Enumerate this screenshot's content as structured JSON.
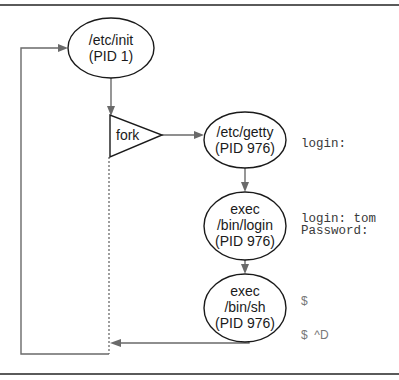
{
  "diagram": {
    "nodes": {
      "init": {
        "line1": "/etc/init",
        "line2": "(PID 1)"
      },
      "fork": {
        "label": "fork"
      },
      "getty": {
        "line1": "/etc/getty",
        "line2": "(PID 976)"
      },
      "login": {
        "line1": "exec",
        "line2": "/bin/login",
        "line3": "(PID 976)"
      },
      "shell": {
        "line1": "exec",
        "line2": "/bin/sh",
        "line3": "(PID 976)"
      }
    },
    "terminal_output": {
      "getty_prompt": "login:",
      "login_line1": "login: tom",
      "login_line2": "Password:",
      "shell_prompt": "$",
      "shell_exit": "$  ^D"
    },
    "colors": {
      "node_stroke": "#1a1a1a",
      "edge": "#6a6a6a",
      "rule": "#5a5a5a"
    }
  }
}
